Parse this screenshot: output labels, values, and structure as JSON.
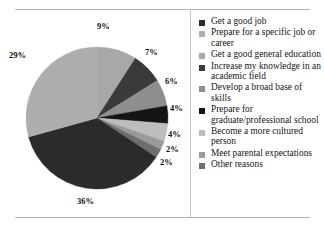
{
  "chart_data": {
    "type": "pie",
    "title": "",
    "xlabel": "",
    "ylabel": "",
    "legend_position": "right",
    "grid": false,
    "units": "percent",
    "total": 99,
    "categories": [
      "Get a good job",
      "Prepare for a specific job or career",
      "Get a good general education",
      "Increase my knowledge in an academic field",
      "Develop a broad base of skills",
      "Prepare for graduate/professional school",
      "Become a more cultured person",
      "Meet parental expectations",
      "Other reasons"
    ],
    "values": [
      36,
      29,
      9,
      7,
      6,
      4,
      4,
      2,
      2
    ],
    "slice_order": [
      {
        "label": "Get a good general education",
        "value": 9,
        "color": "#a8a8a8"
      },
      {
        "label": "Increase my knowledge in an academic field",
        "value": 7,
        "color": "#3a3a3a"
      },
      {
        "label": "Develop a broad base of skills",
        "value": 6,
        "color": "#8e8e8e"
      },
      {
        "label": "Prepare for graduate/professional school",
        "value": 4,
        "color": "#141414"
      },
      {
        "label": "Become a more cultured person",
        "value": 4,
        "color": "#bdbdbd"
      },
      {
        "label": "Meet parental expectations",
        "value": 2,
        "color": "#9a9a9a"
      },
      {
        "label": "Other reasons",
        "value": 2,
        "color": "#6e6e6e"
      },
      {
        "label": "Get a good job",
        "value": 36,
        "color": "#2b2b2b"
      },
      {
        "label": "Prepare for a specific job or career",
        "value": 29,
        "color": "#aeaeae"
      }
    ],
    "data_labels": [
      "9%",
      "7%",
      "6%",
      "4%",
      "4%",
      "2%",
      "2%",
      "36%",
      "29%"
    ]
  },
  "pie_labels": {
    "l_9": "9%",
    "l_7": "7%",
    "l_6": "6%",
    "l_4a": "4%",
    "l_4b": "4%",
    "l_2a": "2%",
    "l_2b": "2%",
    "l_36": "36%",
    "l_29": "29%"
  },
  "legend": {
    "items": [
      {
        "label": "Get a good job",
        "color": "#2b2b2b"
      },
      {
        "label": "Prepare for a specific job or career",
        "color": "#aeaeae"
      },
      {
        "label": "Get a good general education",
        "color": "#a8a8a8"
      },
      {
        "label": "Increase my knowledge in an academic field",
        "color": "#3a3a3a"
      },
      {
        "label": "Develop a broad base of skills",
        "color": "#8e8e8e"
      },
      {
        "label": "Prepare for graduate/professional school",
        "color": "#141414"
      },
      {
        "label": "Become a more cultured person",
        "color": "#bdbdbd"
      },
      {
        "label": "Meet parental expectations",
        "color": "#9a9a9a"
      },
      {
        "label": "Other reasons",
        "color": "#6e6e6e"
      }
    ]
  },
  "style": {
    "rule_color": "#b9b9b9",
    "divider_color": "#c3c3c3",
    "background": "#ffffff",
    "text_color": "#161616"
  }
}
